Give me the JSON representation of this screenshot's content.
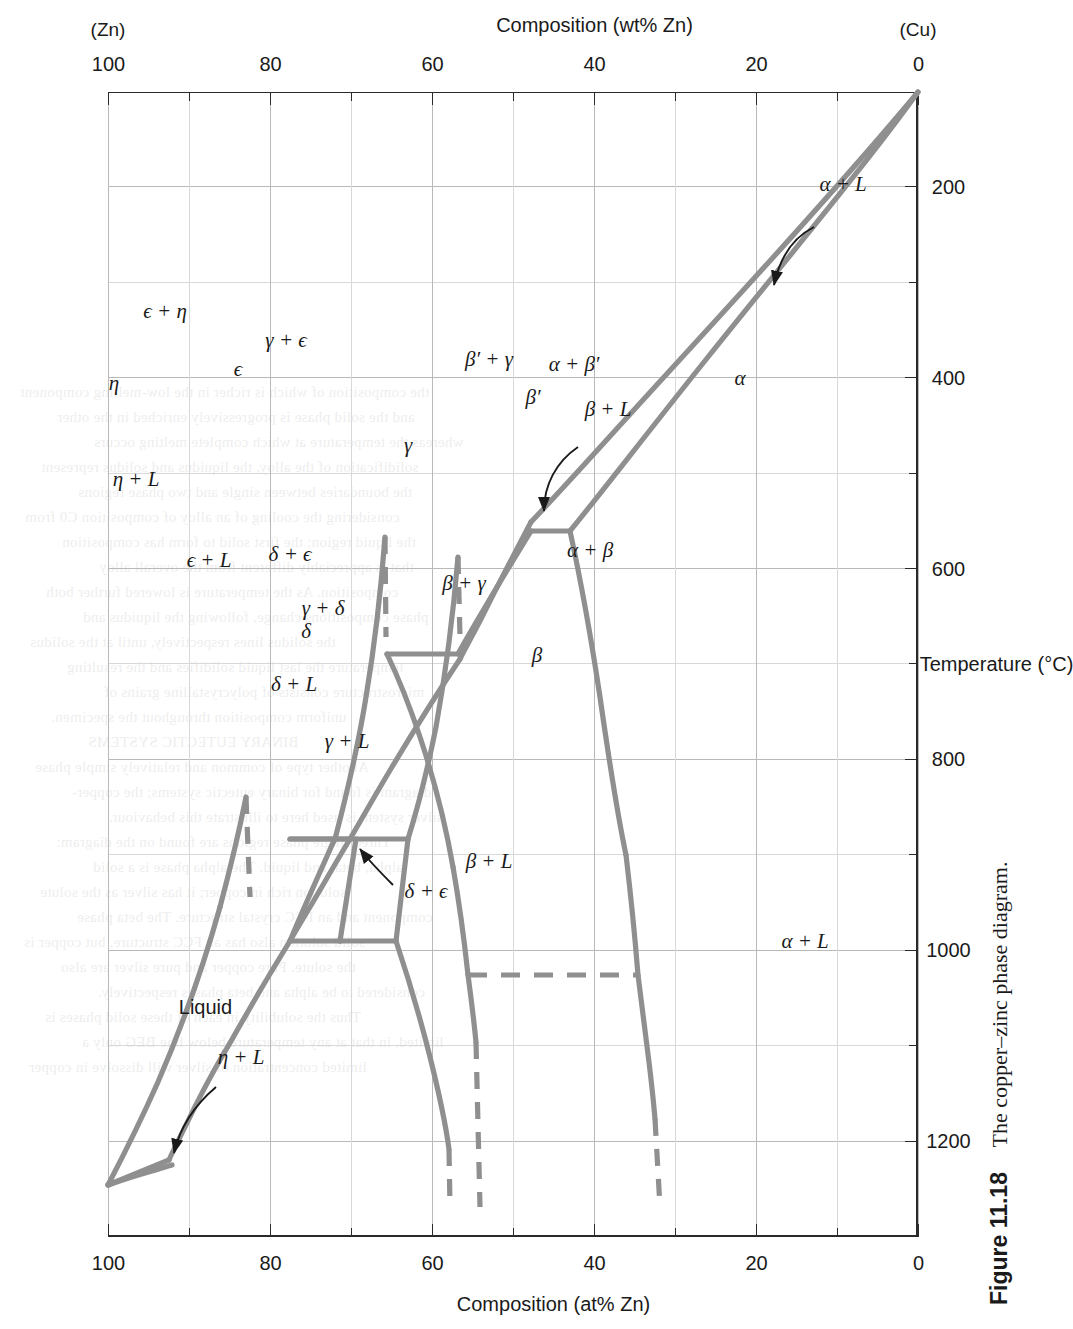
{
  "figure": {
    "number": "Figure 11.18",
    "caption": "The copper–zinc phase diagram."
  },
  "axes": {
    "left": {
      "title": "Composition (at% Zn)",
      "ticks": [
        "0",
        "20",
        "40",
        "60",
        "80",
        "100"
      ],
      "tick_values": [
        0,
        20,
        40,
        60,
        80,
        100
      ]
    },
    "right": {
      "title": "Composition (wt% Zn)",
      "ticks": [
        "0",
        "20",
        "40",
        "60",
        "80",
        "100"
      ],
      "tick_values": [
        0,
        20,
        40,
        60,
        80,
        100
      ],
      "end_label_low": "(Cu)",
      "end_label_high": "(Zn)"
    },
    "bottom": {
      "title": "Temperature (°C)",
      "ticks": [
        "200",
        "400",
        "600",
        "800",
        "1000",
        "1200"
      ],
      "tick_values": [
        200,
        400,
        600,
        800,
        1000,
        1200
      ]
    }
  },
  "phase_labels": [
    {
      "name": "liquid",
      "text": "Liquid",
      "comp": 88.0,
      "temp": 1060
    },
    {
      "name": "alpha-plus-L",
      "text": "α + L",
      "comp": 14.0,
      "temp": 990
    },
    {
      "name": "beta-plus-L",
      "text": "β + L",
      "comp": 53.0,
      "temp": 905
    },
    {
      "name": "gamma-plus-L",
      "text": "γ + L",
      "comp": 70.5,
      "temp": 780
    },
    {
      "name": "delta-plus-L",
      "text": "δ + L",
      "comp": 77.0,
      "temp": 720
    },
    {
      "name": "epsilon-plus-L",
      "text": "ϵ + L",
      "comp": 87.5,
      "temp": 590
    },
    {
      "name": "eta-plus-L",
      "text": "η + L",
      "comp": 96.5,
      "temp": 505
    },
    {
      "name": "eta",
      "text": "η",
      "comp": 99.2,
      "temp": 405
    },
    {
      "name": "epsilon-plus-eta",
      "text": "ϵ + η",
      "comp": 93.0,
      "temp": 330
    },
    {
      "name": "epsilon",
      "text": "ϵ",
      "comp": 84.0,
      "temp": 390
    },
    {
      "name": "delta",
      "text": "δ",
      "comp": 75.5,
      "temp": 665
    },
    {
      "name": "delta-plus-epsilon",
      "text": "δ + ϵ",
      "comp": 77.5,
      "temp": 585
    },
    {
      "name": "gamma-plus-delta",
      "text": "γ + δ",
      "comp": 73.5,
      "temp": 640
    },
    {
      "name": "gamma-plus-epsilon",
      "text": "γ + ϵ",
      "comp": 78.0,
      "temp": 360
    },
    {
      "name": "gamma",
      "text": "γ",
      "comp": 63.0,
      "temp": 470
    },
    {
      "name": "beta-plus-gamma",
      "text": "β + γ",
      "comp": 56.0,
      "temp": 615
    },
    {
      "name": "beta-prime-plus-gamma",
      "text": "β′ + γ",
      "comp": 53.0,
      "temp": 380
    },
    {
      "name": "beta",
      "text": "β",
      "comp": 47.0,
      "temp": 690
    },
    {
      "name": "beta-prime",
      "text": "β′",
      "comp": 47.5,
      "temp": 420
    },
    {
      "name": "alpha-plus-beta",
      "text": "α + β",
      "comp": 40.5,
      "temp": 580
    },
    {
      "name": "alpha-plus-beta-prime",
      "text": "α + β′",
      "comp": 42.5,
      "temp": 385
    },
    {
      "name": "alpha",
      "text": "α",
      "comp": 22.0,
      "temp": 400
    }
  ],
  "annotations": [
    {
      "name": "alpha-plus-L-arrow",
      "label": "α + L"
    },
    {
      "name": "beta-plus-L-arrow",
      "label": "β + L"
    },
    {
      "name": "eta-plus-L-arrow",
      "label": "η + L"
    },
    {
      "name": "delta-plus-epsilon-arrow",
      "label": "δ + ϵ"
    }
  ],
  "style": {
    "curve_color": "#8f8f8f",
    "frame_color": "#2a2a2a",
    "grid_color": "#b9b9b9",
    "paper": "#ffffff"
  },
  "bleed_lines": [
    "the composition of which is richer in the low-melting component",
    "and the solid phase is progressively enriched in the other",
    "whereas the temperature at which complete melting occurs",
    "solidification of the alloy, the liquidus and solidus represent",
    "the boundaries between single and two phase regions",
    "considering the cooling of an alloy of composition C0 from",
    "the liquid region; the first solid to form has composition",
    "that is appreciably different from the overall alloy",
    "composition. As the temperature is lowered further both",
    "phase compositions change, following the liquidus and",
    "the solidus lines respectively, until at the solidus",
    "temperature the last liquid solidifies and the resulting",
    "microstructure consists of polycrystalline grains of",
    "uniform composition throughout the specimen.",
    "BINARY EUTECTIC SYSTEMS",
    "Another type of common and relatively simple phase",
    "diagram is found for binary eutectic systems; the copper-",
    "silver system is used here to illustrate this behaviour.",
    "Three single phase regions are found on the diagram:",
    "alpha, beta, and liquid. The alpha phase is a solid",
    "solution rich in copper; it has silver as the solute",
    "component and an FCC crystal structure. The beta phase",
    "solid solution also has an FCC structure, but copper is",
    "the solute. Pure copper and pure silver are also",
    "considered to be alpha and beta phases respectively.",
    "Thus the solubility in each of these solid phases is",
    "limited, in that at any temperature below line BEG only a",
    "limited concentration of silver will dissolve in copper"
  ]
}
